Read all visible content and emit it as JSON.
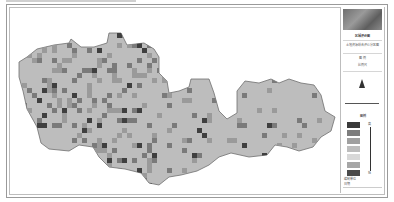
{
  "map": {
    "type": "raster grid thematic map",
    "base_color": "#bdbdbd",
    "outline_color": "#6e6e6e",
    "cell_colors": [
      "#3f3f3f",
      "#7a7a7a",
      "#9a9a9a",
      "#a8a8a8",
      "#c7c7c7",
      "#d4d4d4"
    ]
  },
  "legend": {
    "title": "图例",
    "map_title": "区域评价图",
    "subtitle": "土地资源综合评价分区图",
    "section": "图 例",
    "scale_note": "比例尺",
    "high_label": "高",
    "low_label": "低",
    "swatches": [
      {
        "color": "#3a3a3a"
      },
      {
        "color": "#7d7d7d"
      },
      {
        "color": "#a0a0a0"
      },
      {
        "color": "#bdbdbd"
      },
      {
        "color": "#d8d8d8"
      },
      {
        "color": "#a6a6a6"
      },
      {
        "color": "#4a4a4a"
      }
    ],
    "footer_org": "编制单位",
    "footer_date": "日期"
  }
}
